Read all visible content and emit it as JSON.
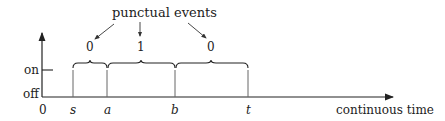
{
  "title": "punctual events",
  "axes": {
    "x_label": "continuous time",
    "y_labels": {
      "on": "on",
      "off": "off"
    },
    "origin_label": "0"
  },
  "time_points": [
    {
      "label": "s",
      "x": 73
    },
    {
      "label": "a",
      "x": 107
    },
    {
      "label": "b",
      "x": 175
    },
    {
      "label": "t",
      "x": 248
    }
  ],
  "intervals": [
    {
      "from": "s",
      "to": "a",
      "value": "0"
    },
    {
      "from": "a",
      "to": "b",
      "value": "1"
    },
    {
      "from": "b",
      "to": "t",
      "value": "0"
    }
  ],
  "colors": {
    "line": "#222222",
    "grayline": "#888888"
  }
}
